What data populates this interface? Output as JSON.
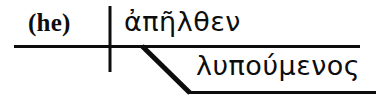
{
  "diagram": {
    "type": "reed-kellogg-sentence-diagram",
    "language": "Greek",
    "ink_color": "#0d0d0d",
    "background_color": "#ffffff",
    "subject": {
      "text": "(he)",
      "role": "implied-subject",
      "note": "parenthesized English gloss of the implied subject"
    },
    "verb": {
      "text": "ἀπῆλθεν",
      "role": "main-verb"
    },
    "participle": {
      "text": "λυπούμενος",
      "role": "participle-modifier"
    },
    "lines": {
      "baseline": {
        "name": "main-horizontal-baseline",
        "x1": 14,
        "y1": 46,
        "x2": 360,
        "y2": 46,
        "width": 3
      },
      "subject_verb_divider": {
        "name": "subject-verb-divider",
        "x1": 110,
        "y1": 6,
        "x2": 110,
        "y2": 72,
        "width": 3
      },
      "modifier_slant": {
        "name": "participle-slant-line",
        "x1": 142,
        "y1": 47,
        "x2": 190,
        "y2": 93,
        "width": 5
      },
      "modifier_baseline": {
        "name": "participle-horizontal-line",
        "x1": 188,
        "y1": 93,
        "x2": 376,
        "y2": 93,
        "width": 3
      }
    }
  }
}
